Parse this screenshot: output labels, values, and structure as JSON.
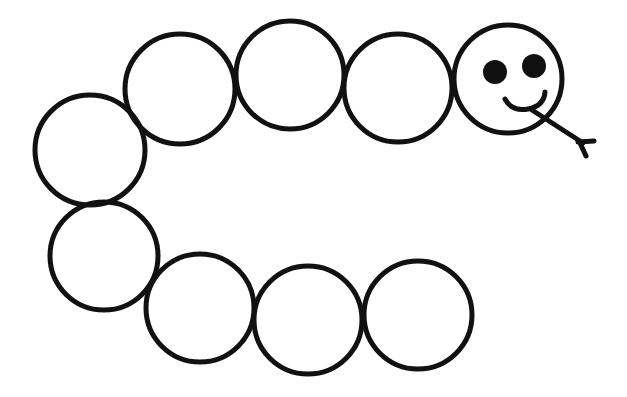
{
  "drawing": {
    "subject": "caterpillar",
    "style": "black outline line art on white",
    "body_segment_count": 9,
    "features": [
      "head-with-two-eyes",
      "smile",
      "forked-tongue"
    ],
    "colors": {
      "stroke": "#111111",
      "background": "#ffffff"
    }
  }
}
